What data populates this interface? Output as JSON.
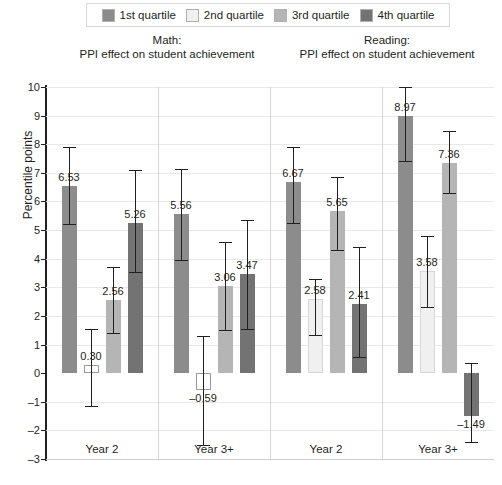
{
  "legend": {
    "items": [
      {
        "label": "1st quartile",
        "color": "#8c8c8c"
      },
      {
        "label": "2nd quartile",
        "color": "#f0f0f0"
      },
      {
        "label": "3rd quartile",
        "color": "#b5b5b5"
      },
      {
        "label": "4th quartile",
        "color": "#737373"
      }
    ]
  },
  "titles": {
    "math": "Math:\nPPI effect on student achievement",
    "math_line1": "Math:",
    "math_line2": "PPI effect on student achievement",
    "reading_line1": "Reading:",
    "reading_line2": "PPI effect on student achievement"
  },
  "axis": {
    "ylabel": "Percentile points",
    "yticks": [
      "10",
      "9",
      "8",
      "7",
      "6",
      "5",
      "4",
      "3",
      "2",
      "1",
      "0",
      "–1",
      "–2",
      "–3"
    ],
    "ymin": -3,
    "ymax": 10,
    "categories": [
      "Year 2",
      "Year 3+",
      "Year 2",
      "Year 3+"
    ]
  },
  "chart_data": {
    "type": "bar",
    "title": "PPI effect on student achievement",
    "subtitle": "Math and Reading by quartile",
    "xlabel": "",
    "ylabel": "Percentile points",
    "ylim": [
      -3,
      10
    ],
    "grid": true,
    "legend_position": "top",
    "categories": [
      "Math Year 2",
      "Math Year 3+",
      "Reading Year 2",
      "Reading Year 3+"
    ],
    "category_labels": [
      "Year 2",
      "Year 3+",
      "Year 2",
      "Year 3+"
    ],
    "panels": [
      "Math:",
      "Reading:"
    ],
    "series": [
      {
        "name": "1st quartile",
        "color": "#8c8c8c",
        "values": [
          6.53,
          5.56,
          6.67,
          8.97
        ]
      },
      {
        "name": "2nd quartile",
        "color": "#f0f0f0",
        "values": [
          0.3,
          -0.59,
          2.58,
          3.58
        ]
      },
      {
        "name": "3rd quartile",
        "color": "#b5b5b5",
        "values": [
          2.56,
          3.06,
          5.65,
          7.36
        ]
      },
      {
        "name": "4th quartile",
        "color": "#737373",
        "values": [
          5.26,
          3.47,
          2.41,
          -1.49
        ]
      }
    ],
    "data_labels": [
      [
        "6.53",
        "0.30",
        "2.56",
        "5.26"
      ],
      [
        "5.56",
        "–0.59",
        "3.06",
        "3.47"
      ],
      [
        "6.67",
        "2.58",
        "5.65",
        "2.41"
      ],
      [
        "8.97",
        "3.58",
        "7.36",
        "–1.49"
      ]
    ],
    "error_bars": [
      [
        {
          "lo": 5.2,
          "hi": 7.9
        },
        {
          "lo": -1.15,
          "hi": 1.55
        },
        {
          "lo": 1.4,
          "hi": 3.7
        },
        {
          "lo": 3.55,
          "hi": 7.1
        }
      ],
      [
        {
          "lo": 3.95,
          "hi": 7.15
        },
        {
          "lo": -2.5,
          "hi": 1.3
        },
        {
          "lo": 1.5,
          "hi": 4.6
        },
        {
          "lo": 1.55,
          "hi": 5.35
        }
      ],
      [
        {
          "lo": 5.25,
          "hi": 7.9
        },
        {
          "lo": 1.35,
          "hi": 3.3
        },
        {
          "lo": 4.3,
          "hi": 6.85
        },
        {
          "lo": 0.55,
          "hi": 4.4
        }
      ],
      [
        {
          "lo": 7.4,
          "hi": 10.0
        },
        {
          "lo": 2.3,
          "hi": 4.8
        },
        {
          "lo": 6.3,
          "hi": 8.45
        },
        {
          "lo": -2.4,
          "hi": 0.35
        }
      ]
    ]
  }
}
